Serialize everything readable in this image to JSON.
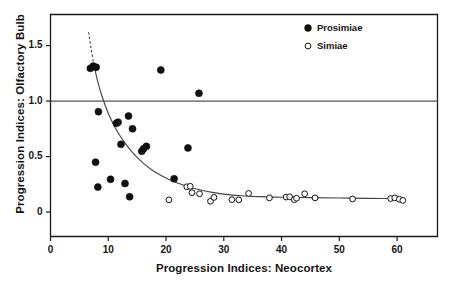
{
  "chart_data": {
    "type": "scatter",
    "title": "",
    "xlabel": "Progression Indices: Neocortex",
    "ylabel": "Progression Indices: Olfactory Bulb",
    "xlim": [
      0,
      67
    ],
    "ylim": [
      -0.22,
      1.78
    ],
    "xticks": [
      0,
      10,
      20,
      30,
      40,
      50,
      60
    ],
    "xtick_labels": [
      "0",
      "10",
      "20",
      "30",
      "40",
      "50",
      "60"
    ],
    "yticks": [
      0,
      0.5,
      1.0,
      1.5
    ],
    "ytick_labels": [
      "0",
      "0.5",
      "1.0",
      "1.5"
    ],
    "grid": false,
    "reference_lines": [
      {
        "axis": "y",
        "value": 1.0,
        "style": "solid",
        "color": "#555555"
      }
    ],
    "legend_position": "top-right",
    "series": [
      {
        "name": "Prosimiae",
        "marker": "filled-circle",
        "color": "#111111",
        "points": [
          [
            6.9,
            1.295
          ],
          [
            7.4,
            1.315
          ],
          [
            7.9,
            1.305
          ],
          [
            8.3,
            0.905
          ],
          [
            7.8,
            0.45
          ],
          [
            8.2,
            0.225
          ],
          [
            10.4,
            0.295
          ],
          [
            11.4,
            0.8
          ],
          [
            11.7,
            0.81
          ],
          [
            12.2,
            0.61
          ],
          [
            12.9,
            0.258
          ],
          [
            13.5,
            0.865
          ],
          [
            13.7,
            0.138
          ],
          [
            14.2,
            0.75
          ],
          [
            15.8,
            0.548
          ],
          [
            16.1,
            0.57
          ],
          [
            16.6,
            0.592
          ],
          [
            19.1,
            1.28
          ],
          [
            21.4,
            0.3
          ],
          [
            23.8,
            0.578
          ],
          [
            25.7,
            1.07
          ]
        ]
      },
      {
        "name": "Simiae",
        "marker": "open-circle",
        "color": "#111111",
        "points": [
          [
            20.5,
            0.11
          ],
          [
            23.6,
            0.228
          ],
          [
            24.2,
            0.232
          ],
          [
            24.5,
            0.175
          ],
          [
            25.8,
            0.165
          ],
          [
            27.7,
            0.098
          ],
          [
            28.3,
            0.132
          ],
          [
            31.4,
            0.112
          ],
          [
            32.6,
            0.11
          ],
          [
            34.3,
            0.168
          ],
          [
            37.9,
            0.128
          ],
          [
            40.8,
            0.135
          ],
          [
            41.4,
            0.138
          ],
          [
            42.2,
            0.112
          ],
          [
            42.6,
            0.125
          ],
          [
            44.0,
            0.165
          ],
          [
            45.8,
            0.128
          ],
          [
            52.3,
            0.118
          ],
          [
            58.9,
            0.122
          ],
          [
            59.6,
            0.128
          ],
          [
            60.4,
            0.115
          ],
          [
            61.0,
            0.105
          ]
        ]
      }
    ],
    "fit_curve": {
      "name": "exponential-decay-fit",
      "style": "solid-with-dashed-extension",
      "color": "#444444",
      "points": [
        [
          6.6,
          1.62
        ],
        [
          7.0,
          1.48
        ],
        [
          7.5,
          1.33
        ],
        [
          8.2,
          1.17
        ],
        [
          9.0,
          1.03
        ],
        [
          10.0,
          0.89
        ],
        [
          11.0,
          0.78
        ],
        [
          12.0,
          0.69
        ],
        [
          13.0,
          0.615
        ],
        [
          14.0,
          0.55
        ],
        [
          15.0,
          0.492
        ],
        [
          16.0,
          0.443
        ],
        [
          17.5,
          0.382
        ],
        [
          19.0,
          0.333
        ],
        [
          20.5,
          0.294
        ],
        [
          22.0,
          0.262
        ],
        [
          24.0,
          0.226
        ],
        [
          26.0,
          0.199
        ],
        [
          28.0,
          0.178
        ],
        [
          30.0,
          0.162
        ],
        [
          33.0,
          0.147
        ],
        [
          36.0,
          0.139
        ],
        [
          40.0,
          0.134
        ],
        [
          45.0,
          0.13
        ],
        [
          50.0,
          0.127
        ],
        [
          55.0,
          0.124
        ],
        [
          61.0,
          0.12
        ]
      ]
    }
  },
  "legend": {
    "entries": [
      {
        "label": "Prosimiae",
        "marker": "filled-circle"
      },
      {
        "label": "Simiae",
        "marker": "open-circle"
      }
    ]
  }
}
